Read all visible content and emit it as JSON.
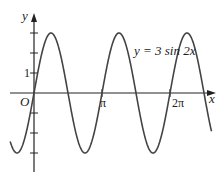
{
  "chart_data": {
    "type": "line",
    "title": "",
    "equation_label": "y = 3 sin 2x",
    "xlabel": "x",
    "ylabel": "y",
    "origin_label": "O",
    "x_tick_labels": [
      "π",
      "2π"
    ],
    "x_ticks": [
      3.14159,
      6.28318
    ],
    "y_tick_labels": [
      "1"
    ],
    "y_ticks": [
      -3,
      -2,
      -1,
      1,
      2,
      3
    ],
    "xlim": [
      -0.75,
      8.3
    ],
    "ylim": [
      -4,
      3.6
    ],
    "series": [
      {
        "name": "y=3 sin 2x",
        "function": "3*sin(2*x)",
        "x_range": [
          -1.1,
          8.2
        ],
        "amplitude": 3,
        "period": 3.14159
      }
    ],
    "grid": false,
    "legend": "none"
  },
  "colors": {
    "curve": "#444444",
    "axis": "#222222"
  }
}
